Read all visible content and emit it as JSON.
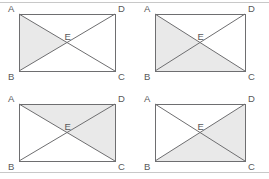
{
  "figure": {
    "colors": {
      "shade": "#e9e9e9",
      "stroke": "#6e6e70",
      "label": "#58585a",
      "background": "#ffffff",
      "rule": "#c8c8c8"
    },
    "vertex_labels": {
      "a": "A",
      "b": "B",
      "c": "C",
      "d": "D",
      "e": "E"
    },
    "panels": [
      {
        "id": "panel-top-left",
        "position": "top-left",
        "rect": {
          "x": 19,
          "y": 14,
          "w": 96,
          "h": 57
        },
        "shaded_triangles": [
          "ABE"
        ]
      },
      {
        "id": "panel-top-right",
        "position": "top-right",
        "rect": {
          "x": 155,
          "y": 14,
          "w": 90,
          "h": 57
        },
        "shaded_triangles": [
          "ABE",
          "BCE"
        ]
      },
      {
        "id": "panel-bottom-left",
        "position": "bottom-left",
        "rect": {
          "x": 19,
          "y": 104,
          "w": 96,
          "h": 57
        },
        "shaded_triangles": [
          "ADE",
          "DCE"
        ]
      },
      {
        "id": "panel-bottom-right",
        "position": "bottom-right",
        "rect": {
          "x": 155,
          "y": 104,
          "w": 90,
          "h": 57
        },
        "shaded_triangles": [
          "DCE",
          "BCE"
        ]
      }
    ],
    "rules": [
      {
        "id": "top-rule",
        "y": 2,
        "x1": 0,
        "x2": 269
      },
      {
        "id": "bottom-rule",
        "y": 172,
        "x1": 0,
        "x2": 269
      }
    ]
  }
}
